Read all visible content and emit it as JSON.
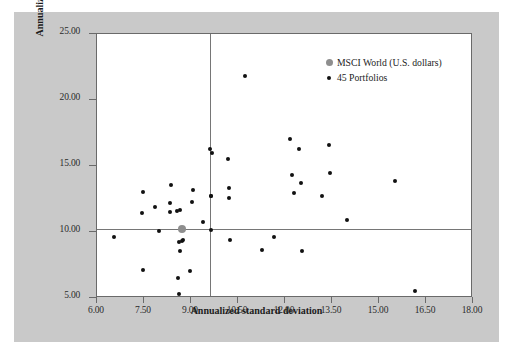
{
  "figure": {
    "background_color": "#c9c9c9",
    "plot_background_color": "#ffffff",
    "frame_color": "#6a6a6a"
  },
  "legend": {
    "position": "top-right-inside",
    "entries": [
      {
        "label": "MSCI World (U.S. dollars)",
        "marker": "filled-circle-gray",
        "color": "#8e8e8e",
        "icon": "legend-dot-icon"
      },
      {
        "label": "45 Portfolios",
        "marker": "filled-circle-black",
        "color": "#111111",
        "icon": "legend-dot-icon"
      }
    ]
  },
  "chart_data": {
    "type": "scatter",
    "title": "",
    "xlabel": "Annualized standard deviation",
    "ylabel": "Annualized rate of return in percent",
    "xlim": [
      6.0,
      18.0
    ],
    "ylim": [
      5.0,
      25.0
    ],
    "xticks": [
      6.0,
      7.5,
      9.0,
      10.5,
      12.0,
      13.5,
      15.0,
      16.5,
      18.0
    ],
    "xtick_labels": [
      "6.00",
      "7.50",
      "9.00",
      "10.50",
      "12.00",
      "13.50",
      "15.00",
      "16.50",
      "18.00"
    ],
    "yticks": [
      5.0,
      10.0,
      15.0,
      20.0,
      25.0
    ],
    "ytick_labels": [
      "5.00",
      "10.00",
      "15.00",
      "20.00",
      "25.00"
    ],
    "grid": false,
    "reference_lines": [
      {
        "orientation": "vertical",
        "value": 9.62,
        "color": "#767676",
        "name": "msci-std-dev-reference"
      },
      {
        "orientation": "horizontal",
        "value": 10.25,
        "color": "#767676",
        "name": "msci-return-reference"
      }
    ],
    "series": [
      {
        "name": "MSCI World (U.S. dollars)",
        "marker": "circle",
        "color": "#8e8e8e",
        "size": "large",
        "points": [
          {
            "x": 8.72,
            "y": 10.24
          }
        ]
      },
      {
        "name": "45 Portfolios",
        "marker": "circle",
        "color": "#111111",
        "size": "small",
        "points": [
          {
            "x": 6.53,
            "y": 9.59
          },
          {
            "x": 7.47,
            "y": 13.02
          },
          {
            "x": 7.45,
            "y": 11.47
          },
          {
            "x": 7.47,
            "y": 7.12
          },
          {
            "x": 7.86,
            "y": 11.87
          },
          {
            "x": 7.99,
            "y": 10.06
          },
          {
            "x": 8.35,
            "y": 13.57
          },
          {
            "x": 8.33,
            "y": 12.16
          },
          {
            "x": 8.33,
            "y": 11.53
          },
          {
            "x": 8.55,
            "y": 11.62
          },
          {
            "x": 8.66,
            "y": 11.63
          },
          {
            "x": 8.62,
            "y": 9.26
          },
          {
            "x": 8.73,
            "y": 9.36
          },
          {
            "x": 8.64,
            "y": 8.55
          },
          {
            "x": 8.6,
            "y": 6.53
          },
          {
            "x": 8.62,
            "y": 5.33
          },
          {
            "x": 9.06,
            "y": 13.2
          },
          {
            "x": 9.04,
            "y": 12.25
          },
          {
            "x": 8.97,
            "y": 7.08
          },
          {
            "x": 9.38,
            "y": 10.72
          },
          {
            "x": 9.62,
            "y": 16.32
          },
          {
            "x": 9.68,
            "y": 15.97
          },
          {
            "x": 9.63,
            "y": 12.72
          },
          {
            "x": 9.64,
            "y": 10.18
          },
          {
            "x": 10.17,
            "y": 15.55
          },
          {
            "x": 10.22,
            "y": 13.35
          },
          {
            "x": 10.2,
            "y": 12.55
          },
          {
            "x": 10.24,
            "y": 9.36
          },
          {
            "x": 10.73,
            "y": 21.8
          },
          {
            "x": 11.28,
            "y": 8.67
          },
          {
            "x": 11.66,
            "y": 9.61
          },
          {
            "x": 12.16,
            "y": 17.08
          },
          {
            "x": 12.23,
            "y": 14.33
          },
          {
            "x": 12.28,
            "y": 12.98
          },
          {
            "x": 12.44,
            "y": 16.32
          },
          {
            "x": 12.52,
            "y": 13.72
          },
          {
            "x": 12.53,
            "y": 8.59
          },
          {
            "x": 13.18,
            "y": 12.7
          },
          {
            "x": 13.41,
            "y": 16.56
          },
          {
            "x": 13.45,
            "y": 14.48
          },
          {
            "x": 13.99,
            "y": 10.92
          },
          {
            "x": 15.52,
            "y": 13.88
          },
          {
            "x": 16.15,
            "y": 5.52
          },
          {
            "x": 9.64,
            "y": 12.72
          },
          {
            "x": 8.72,
            "y": 9.3
          }
        ]
      }
    ]
  }
}
